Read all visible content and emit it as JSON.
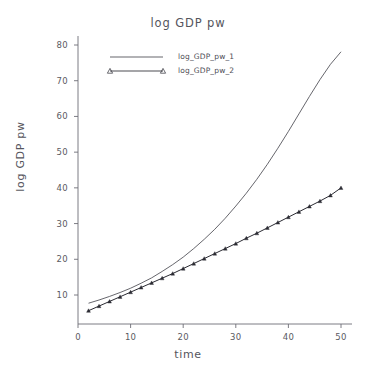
{
  "chart_data": {
    "type": "line",
    "title": "log GDP pw",
    "xlabel": "time",
    "ylabel": "log GDP pw",
    "xlim": [
      0,
      52
    ],
    "ylim": [
      0,
      84
    ],
    "xticks": [
      0,
      10,
      20,
      30,
      40,
      50
    ],
    "yticks": [
      10,
      20,
      30,
      40,
      50,
      60,
      70,
      80
    ],
    "grid": false,
    "legend_position": "top-left-inside",
    "x": [
      2,
      4,
      6,
      8,
      10,
      12,
      14,
      16,
      18,
      20,
      22,
      24,
      26,
      28,
      30,
      32,
      34,
      36,
      38,
      40,
      42,
      44,
      46,
      48,
      50
    ],
    "series": [
      {
        "name": "log_GDP_pw_1",
        "marker": "none",
        "line_color": "#4a4a52",
        "values": [
          7.7,
          8.6,
          9.6,
          10.7,
          11.9,
          13.3,
          14.8,
          16.6,
          18.5,
          20.6,
          23.0,
          25.6,
          28.4,
          31.5,
          34.9,
          38.5,
          42.4,
          46.6,
          51.1,
          55.8,
          60.7,
          65.6,
          70.3,
          74.6,
          78.1
        ]
      },
      {
        "name": "log_GDP_pw_2",
        "marker": "triangle",
        "line_color": "#2b2b33",
        "values": [
          5.6,
          6.9,
          8.2,
          9.5,
          10.8,
          12.1,
          13.4,
          14.7,
          16.0,
          17.4,
          18.8,
          20.2,
          21.6,
          23.0,
          24.4,
          25.9,
          27.3,
          28.8,
          30.3,
          31.8,
          33.3,
          34.8,
          36.3,
          37.9,
          40.0
        ]
      }
    ]
  },
  "legend": {
    "entries": [
      {
        "label": "log_GDP_pw_1"
      },
      {
        "label": "log_GDP_pw_2"
      }
    ]
  }
}
